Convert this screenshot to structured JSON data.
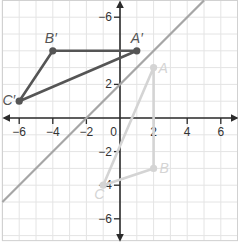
{
  "diagram": {
    "type": "coordinate-plane-transformation",
    "axes": {
      "x_range": [
        -7,
        7
      ],
      "y_range": [
        -7.3,
        7
      ],
      "x_ticks": [
        -6,
        -4,
        -2,
        2,
        4,
        6
      ],
      "y_ticks": [
        6,
        4,
        2,
        -2,
        -4,
        -6
      ],
      "x_tick_labels": [
        "−6",
        "−4",
        "−2",
        "2",
        "4",
        "6"
      ],
      "y_tick_labels": [
        "−6",
        "4",
        "2",
        "−2",
        "−4",
        "−6"
      ],
      "origin_label": "0",
      "grid_step": 1
    },
    "line_of_reflection": {
      "equation": "y = x + 2",
      "slope": 1,
      "intercept": 2,
      "color": "#a6a6a6"
    },
    "original_triangle": {
      "color": "#d4d4d4",
      "vertices": [
        {
          "label": "A",
          "x": 2,
          "y": 3
        },
        {
          "label": "B",
          "x": 2,
          "y": -3
        },
        {
          "label": "C",
          "x": -1,
          "y": -4
        }
      ]
    },
    "image_triangle": {
      "color": "#555555",
      "vertices": [
        {
          "label": "A′",
          "x": 1,
          "y": 4
        },
        {
          "label": "B′",
          "x": -4,
          "y": 4
        },
        {
          "label": "C′",
          "x": -6,
          "y": 1
        }
      ]
    },
    "colors": {
      "grid": "#e4e4e4",
      "axis": "#2b2b2b",
      "border": "#cfcfcf"
    }
  }
}
